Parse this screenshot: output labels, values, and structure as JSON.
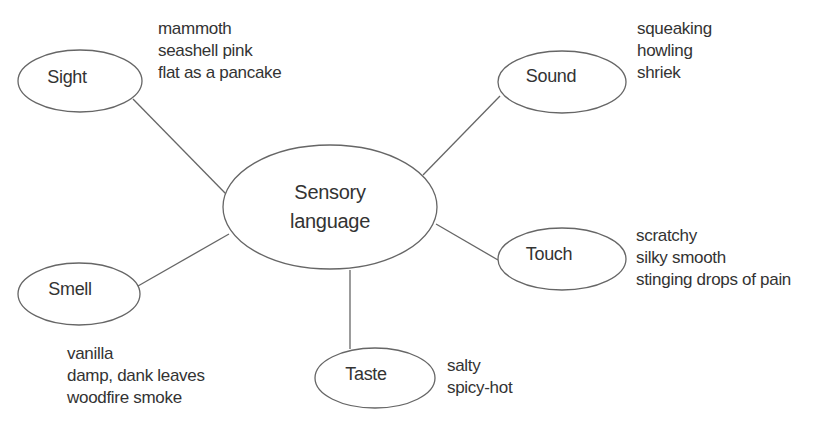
{
  "diagram": {
    "type": "mind-map",
    "colors": {
      "stroke": "#666666",
      "text": "#333333",
      "background": "#ffffff"
    },
    "center": {
      "label_lines": [
        "Sensory",
        "language"
      ]
    },
    "nodes": [
      {
        "id": "sight",
        "label": "Sight",
        "words": [
          "mammoth",
          "seashell pink",
          "flat as a pancake"
        ]
      },
      {
        "id": "sound",
        "label": "Sound",
        "words": [
          "squeaking",
          "howling",
          "shriek"
        ]
      },
      {
        "id": "touch",
        "label": "Touch",
        "words": [
          "scratchy",
          "silky smooth",
          "stinging drops of pain"
        ]
      },
      {
        "id": "smell",
        "label": "Smell",
        "words": [
          "vanilla",
          "damp, dank leaves",
          "woodfire smoke"
        ]
      },
      {
        "id": "taste",
        "label": "Taste",
        "words": [
          "salty",
          "spicy-hot"
        ]
      }
    ]
  }
}
